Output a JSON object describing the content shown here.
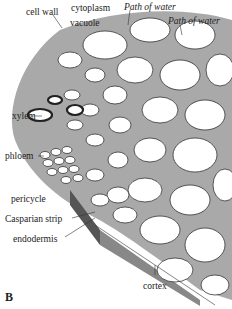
{
  "diagram": {
    "figure_label": "B",
    "labels": {
      "cell_wall": "cell wall",
      "cytoplasm": "cytoplasm",
      "vacuole": "vacuole",
      "path_of_water_1": "Path of water",
      "path_of_water_2": "Path of water",
      "xylem": "xylem",
      "phloem": "phloem",
      "pericycle": "pericycle",
      "casparian_strip": "Casparian strip",
      "endodermis": "endodermis",
      "cortex": "cortex"
    },
    "colors": {
      "cell_wall_fill": "#b8b8b8",
      "cell_lumen": "#ffffff",
      "xylem_dark": "#555555",
      "outline": "#333333"
    }
  }
}
